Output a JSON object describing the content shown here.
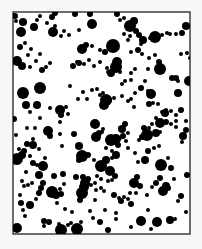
{
  "figure": {
    "background": "#f7f7f7",
    "frame": {
      "x": 13,
      "y": 12,
      "width": 177,
      "height": 222,
      "stroke": "#222222",
      "fill": "#ffffff",
      "stroke_width": 1.3
    },
    "dot_color": "#000000",
    "dots": [
      [
        15,
        16,
        3
      ],
      [
        23,
        22,
        4
      ],
      [
        21,
        32,
        5
      ],
      [
        16,
        21,
        2
      ],
      [
        34,
        27,
        4
      ],
      [
        37,
        20,
        2
      ],
      [
        40,
        16,
        2
      ],
      [
        47,
        23,
        2
      ],
      [
        52,
        17,
        3
      ],
      [
        55,
        13,
        3
      ],
      [
        53,
        32,
        5
      ],
      [
        55,
        26,
        2
      ],
      [
        61,
        36,
        2
      ],
      [
        64,
        31,
        2
      ],
      [
        20,
        47,
        3
      ],
      [
        25,
        43,
        2
      ],
      [
        31,
        49,
        2
      ],
      [
        17,
        61,
        5
      ],
      [
        22,
        66,
        4
      ],
      [
        30,
        67,
        2
      ],
      [
        36,
        61,
        2
      ],
      [
        42,
        70,
        3
      ],
      [
        46,
        67,
        2
      ],
      [
        50,
        63,
        2
      ],
      [
        28,
        55,
        2
      ],
      [
        40,
        54,
        2
      ],
      [
        75,
        14,
        3
      ],
      [
        90,
        14,
        3
      ],
      [
        117,
        14,
        3
      ],
      [
        92,
        24,
        5
      ],
      [
        69,
        35,
        2
      ],
      [
        79,
        30,
        2
      ],
      [
        82,
        49,
        5
      ],
      [
        86,
        45,
        3
      ],
      [
        92,
        46,
        2
      ],
      [
        100,
        50,
        2
      ],
      [
        104,
        52,
        2
      ],
      [
        77,
        62,
        2
      ],
      [
        73,
        66,
        3
      ],
      [
        79,
        63,
        3
      ],
      [
        84,
        64,
        2
      ],
      [
        89,
        60,
        2
      ],
      [
        94,
        66,
        2
      ],
      [
        100,
        62,
        2
      ],
      [
        107,
        68,
        2
      ],
      [
        120,
        20,
        2
      ],
      [
        124,
        18,
        2
      ],
      [
        128,
        23,
        2
      ],
      [
        130,
        26,
        6
      ],
      [
        134,
        21,
        4
      ],
      [
        136,
        31,
        3
      ],
      [
        139,
        35,
        3
      ],
      [
        130,
        36,
        2
      ],
      [
        124,
        34,
        2
      ],
      [
        128,
        40,
        2
      ],
      [
        143,
        40,
        4
      ],
      [
        141,
        44,
        2
      ],
      [
        150,
        38,
        2
      ],
      [
        155,
        37,
        6
      ],
      [
        162,
        35,
        2
      ],
      [
        167,
        33,
        2
      ],
      [
        170,
        34,
        2
      ],
      [
        176,
        34,
        2
      ],
      [
        182,
        33,
        3
      ],
      [
        186,
        26,
        4
      ],
      [
        131,
        52,
        2
      ],
      [
        138,
        50,
        3
      ],
      [
        142,
        54,
        2
      ],
      [
        149,
        58,
        2
      ],
      [
        155,
        55,
        2
      ],
      [
        159,
        62,
        3
      ],
      [
        181,
        54,
        2
      ],
      [
        187,
        53,
        2
      ],
      [
        190,
        58,
        2
      ],
      [
        113,
        46,
        7
      ],
      [
        105,
        52,
        3
      ],
      [
        117,
        62,
        5
      ],
      [
        116,
        67,
        6
      ],
      [
        111,
        73,
        4
      ],
      [
        120,
        72,
        2
      ],
      [
        135,
        69,
        2
      ],
      [
        131,
        73,
        2
      ],
      [
        145,
        81,
        2
      ],
      [
        122,
        84,
        2
      ],
      [
        125,
        81,
        2
      ],
      [
        131,
        80,
        2
      ],
      [
        122,
        96,
        2
      ],
      [
        128,
        101,
        2
      ],
      [
        131,
        99,
        2
      ],
      [
        134,
        107,
        2
      ],
      [
        148,
        69,
        2
      ],
      [
        160,
        69,
        6
      ],
      [
        172,
        78,
        3
      ],
      [
        176,
        78,
        3
      ],
      [
        189,
        81,
        5
      ],
      [
        23,
        93,
        6
      ],
      [
        40,
        88,
        6
      ],
      [
        14,
        119,
        3
      ],
      [
        26,
        105,
        4
      ],
      [
        37,
        105,
        4
      ],
      [
        50,
        108,
        2
      ],
      [
        30,
        112,
        2
      ],
      [
        40,
        118,
        2
      ],
      [
        60,
        110,
        5
      ],
      [
        61,
        115,
        3
      ],
      [
        66,
        107,
        2
      ],
      [
        68,
        114,
        2
      ],
      [
        78,
        99,
        2
      ],
      [
        87,
        99,
        2
      ],
      [
        97,
        89,
        2
      ],
      [
        100,
        95,
        2
      ],
      [
        103,
        93,
        2
      ],
      [
        70,
        86,
        2
      ],
      [
        83,
        92,
        2
      ],
      [
        92,
        90,
        2
      ],
      [
        106,
        100,
        6
      ],
      [
        104,
        105,
        5
      ],
      [
        108,
        100,
        4
      ],
      [
        114,
        98,
        2
      ],
      [
        108,
        72,
        2
      ],
      [
        135,
        93,
        2
      ],
      [
        141,
        88,
        3
      ],
      [
        151,
        94,
        5
      ],
      [
        148,
        91,
        2
      ],
      [
        149,
        104,
        3
      ],
      [
        153,
        103,
        2
      ],
      [
        165,
        113,
        4
      ],
      [
        166,
        110,
        2
      ],
      [
        171,
        111,
        2
      ],
      [
        176,
        115,
        2
      ],
      [
        181,
        110,
        3
      ],
      [
        187,
        82,
        2
      ],
      [
        178,
        93,
        4
      ],
      [
        158,
        104,
        2
      ],
      [
        178,
        81,
        2
      ],
      [
        162,
        112,
        2
      ],
      [
        156,
        118,
        2
      ],
      [
        152,
        124,
        2
      ],
      [
        160,
        123,
        5
      ],
      [
        166,
        122,
        3
      ],
      [
        171,
        124,
        2
      ],
      [
        176,
        121,
        2
      ],
      [
        186,
        121,
        2
      ],
      [
        16,
        135,
        2
      ],
      [
        19,
        149,
        2
      ],
      [
        17,
        159,
        6
      ],
      [
        22,
        155,
        4
      ],
      [
        24,
        151,
        3
      ],
      [
        27,
        144,
        3
      ],
      [
        33,
        139,
        2
      ],
      [
        33,
        145,
        4
      ],
      [
        39,
        149,
        2
      ],
      [
        30,
        156,
        2
      ],
      [
        26,
        172,
        2
      ],
      [
        33,
        163,
        3
      ],
      [
        37,
        165,
        2
      ],
      [
        39,
        175,
        4
      ],
      [
        43,
        166,
        5
      ],
      [
        45,
        158,
        2
      ],
      [
        27,
        128,
        2
      ],
      [
        35,
        128,
        2
      ],
      [
        48,
        131,
        5
      ],
      [
        50,
        136,
        3
      ],
      [
        60,
        134,
        2
      ],
      [
        60,
        122,
        2
      ],
      [
        62,
        146,
        2
      ],
      [
        74,
        134,
        3
      ],
      [
        79,
        146,
        4
      ],
      [
        82,
        156,
        6
      ],
      [
        79,
        160,
        3
      ],
      [
        88,
        155,
        3
      ],
      [
        94,
        160,
        2
      ],
      [
        96,
        137,
        5
      ],
      [
        99,
        133,
        3
      ],
      [
        95,
        124,
        5
      ],
      [
        102,
        132,
        2
      ],
      [
        103,
        129,
        2
      ],
      [
        106,
        148,
        2
      ],
      [
        112,
        151,
        2
      ],
      [
        116,
        155,
        4
      ],
      [
        112,
        142,
        3
      ],
      [
        118,
        145,
        3
      ],
      [
        120,
        138,
        2
      ],
      [
        126,
        141,
        2
      ],
      [
        128,
        133,
        2
      ],
      [
        128,
        148,
        2
      ],
      [
        101,
        166,
        6
      ],
      [
        106,
        160,
        4
      ],
      [
        112,
        158,
        2
      ],
      [
        110,
        171,
        5
      ],
      [
        111,
        140,
        6
      ],
      [
        116,
        139,
        5
      ],
      [
        123,
        136,
        3
      ],
      [
        122,
        129,
        4
      ],
      [
        125,
        124,
        3
      ],
      [
        120,
        128,
        2
      ],
      [
        135,
        153,
        2
      ],
      [
        148,
        151,
        3
      ],
      [
        154,
        148,
        2
      ],
      [
        159,
        146,
        2
      ],
      [
        145,
        160,
        4
      ],
      [
        138,
        162,
        2
      ],
      [
        142,
        137,
        3
      ],
      [
        147,
        135,
        6
      ],
      [
        144,
        128,
        3
      ],
      [
        149,
        128,
        2
      ],
      [
        156,
        133,
        4
      ],
      [
        160,
        132,
        2
      ],
      [
        176,
        127,
        2
      ],
      [
        183,
        136,
        4
      ],
      [
        186,
        130,
        3
      ],
      [
        182,
        142,
        2
      ],
      [
        139,
        140,
        2
      ],
      [
        161,
        165,
        6
      ],
      [
        171,
        168,
        3
      ],
      [
        168,
        158,
        2
      ],
      [
        174,
        179,
        2
      ],
      [
        187,
        175,
        3
      ],
      [
        134,
        183,
        5
      ],
      [
        137,
        177,
        3
      ],
      [
        140,
        186,
        3
      ],
      [
        130,
        193,
        2
      ],
      [
        136,
        193,
        2
      ],
      [
        128,
        199,
        2
      ],
      [
        131,
        204,
        3
      ],
      [
        147,
        195,
        2
      ],
      [
        152,
        187,
        2
      ],
      [
        156,
        183,
        3
      ],
      [
        160,
        178,
        3
      ],
      [
        148,
        210,
        2
      ],
      [
        141,
        221,
        5
      ],
      [
        166,
        186,
        4
      ],
      [
        163,
        191,
        5
      ],
      [
        168,
        188,
        3
      ],
      [
        181,
        196,
        3
      ],
      [
        178,
        201,
        2
      ],
      [
        186,
        212,
        2
      ],
      [
        175,
        219,
        2
      ],
      [
        170,
        220,
        4
      ],
      [
        157,
        222,
        5
      ],
      [
        151,
        229,
        2
      ],
      [
        131,
        227,
        2
      ],
      [
        121,
        201,
        3
      ],
      [
        124,
        197,
        2
      ],
      [
        105,
        210,
        2
      ],
      [
        100,
        222,
        3
      ],
      [
        104,
        191,
        2
      ],
      [
        116,
        213,
        2
      ],
      [
        116,
        219,
        2
      ],
      [
        108,
        230,
        3
      ],
      [
        80,
        200,
        3
      ],
      [
        82,
        193,
        6
      ],
      [
        84,
        187,
        5
      ],
      [
        85,
        183,
        5
      ],
      [
        88,
        179,
        3
      ],
      [
        97,
        176,
        2
      ],
      [
        76,
        177,
        3
      ],
      [
        83,
        177,
        3
      ],
      [
        101,
        188,
        2
      ],
      [
        91,
        185,
        2
      ],
      [
        95,
        183,
        2
      ],
      [
        96,
        190,
        2
      ],
      [
        101,
        179,
        2
      ],
      [
        95,
        200,
        2
      ],
      [
        108,
        181,
        2
      ],
      [
        112,
        180,
        2
      ],
      [
        115,
        176,
        3
      ],
      [
        72,
        212,
        2
      ],
      [
        77,
        229,
        6
      ],
      [
        90,
        211,
        2
      ],
      [
        93,
        218,
        2
      ],
      [
        81,
        222,
        2
      ],
      [
        114,
        195,
        3
      ],
      [
        119,
        198,
        2
      ],
      [
        22,
        181,
        2
      ],
      [
        24,
        186,
        2
      ],
      [
        28,
        185,
        2
      ],
      [
        32,
        183,
        2
      ],
      [
        41,
        188,
        3
      ],
      [
        39,
        193,
        3
      ],
      [
        43,
        183,
        3
      ],
      [
        20,
        195,
        2
      ],
      [
        30,
        205,
        4
      ],
      [
        36,
        199,
        2
      ],
      [
        52,
        192,
        6
      ],
      [
        56,
        195,
        4
      ],
      [
        61,
        194,
        3
      ],
      [
        57,
        203,
        2
      ],
      [
        17,
        228,
        5
      ],
      [
        25,
        216,
        2
      ],
      [
        44,
        221,
        3
      ],
      [
        49,
        222,
        3
      ],
      [
        44,
        226,
        2
      ],
      [
        61,
        230,
        6
      ],
      [
        59,
        224,
        2
      ],
      [
        23,
        210,
        2
      ],
      [
        21,
        203,
        3
      ],
      [
        54,
        176,
        3
      ],
      [
        63,
        174,
        3
      ],
      [
        64,
        184,
        2
      ],
      [
        60,
        189,
        2
      ],
      [
        65,
        209,
        2
      ],
      [
        68,
        225,
        2
      ],
      [
        71,
        223,
        2
      ]
    ]
  }
}
